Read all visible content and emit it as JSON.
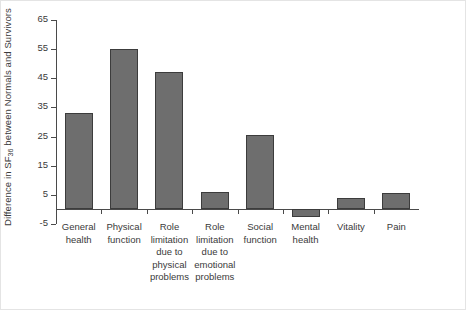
{
  "chart_data": {
    "type": "bar",
    "title": "",
    "xlabel": "",
    "ylabel": "Difference in SF36 between Normals and Survivors",
    "ylabel_main": "Difference in SF",
    "ylabel_sub": "36",
    "ylabel_tail": " between Normals and Survivors",
    "categories": [
      "General\nhealth",
      "Physical\nfunction",
      "Role\nlimitation\ndue to\nphysical\nproblems",
      "Role\nlimitation\ndue to\nemotional\nproblems",
      "Social\nfunction",
      "Mental\nhealth",
      "Vitality",
      "Pain"
    ],
    "values": [
      33,
      55,
      47,
      6,
      25.5,
      -2.5,
      4,
      5.5
    ],
    "ylim": [
      -5,
      65
    ],
    "yticks": [
      65,
      55,
      45,
      35,
      25,
      15,
      5,
      -5
    ],
    "ytick_labels": [
      "65",
      "55",
      "45",
      "35",
      "25",
      "15",
      "5",
      "-5"
    ],
    "grid": false,
    "legend": false,
    "bar_color": "#6e6e6e",
    "bar_edge_color": "#3c3c3c",
    "axis_color": "#4a4a4a",
    "background": "#ffffff"
  }
}
